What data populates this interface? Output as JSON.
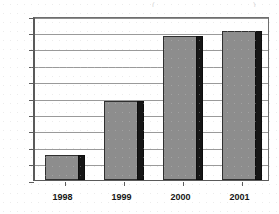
{
  "chart_data": {
    "type": "bar",
    "title": "",
    "xlabel": "",
    "ylabel": "",
    "categories": [
      "1998",
      "1999",
      "2000",
      "2001"
    ],
    "values": [
      165,
      198,
      238,
      241
    ],
    "ylim": [
      150,
      250
    ],
    "ytick_step": 10,
    "yticks": [
      150,
      160,
      170,
      180,
      190,
      200,
      210,
      220,
      230,
      240,
      250
    ],
    "ytick_labels": [
      "150",
      "160",
      "170",
      "180",
      "190",
      "200",
      "210",
      "220",
      "230",
      "240",
      "250"
    ],
    "grid": true,
    "grid_axis": "y",
    "legend": false,
    "legend_position": "none",
    "series": [
      {
        "name": "",
        "values": [
          165,
          198,
          238,
          241
        ]
      }
    ],
    "colors": {
      "bar_face": "#8d8d8d",
      "bar_edge_shadow": "#161616",
      "bar_outline": "#303030",
      "gridline": "#9a9a9a",
      "axis": "#5a5a5a",
      "background": "#ffffff",
      "tick_label": "#2b2b2b",
      "category_label": "#161616"
    },
    "annotations": []
  },
  "axes": {
    "y": {
      "ticks": [
        {
          "label": "250",
          "value": 250
        },
        {
          "label": "240",
          "value": 240
        },
        {
          "label": "230",
          "value": 230
        },
        {
          "label": "220",
          "value": 220
        },
        {
          "label": "210",
          "value": 210
        },
        {
          "label": "200",
          "value": 200
        },
        {
          "label": "190",
          "value": 190
        },
        {
          "label": "180",
          "value": 180
        },
        {
          "label": "170",
          "value": 170
        },
        {
          "label": "160",
          "value": 160
        },
        {
          "label": "150",
          "value": 150
        }
      ]
    },
    "x": {
      "ticks": [
        {
          "label": "1998"
        },
        {
          "label": "1999"
        },
        {
          "label": "2000"
        },
        {
          "label": "2001"
        }
      ]
    }
  },
  "artifacts": {
    "top_left_mark": "(",
    "top_right_mark": ")"
  }
}
